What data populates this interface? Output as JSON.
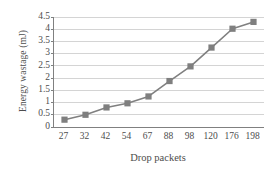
{
  "chart_data": {
    "type": "line",
    "title": "",
    "subtitle": "",
    "xlabel": "Drop packets",
    "ylabel": "Energy wastage (mJ)",
    "categories": [
      "27",
      "32",
      "42",
      "54",
      "67",
      "88",
      "98",
      "120",
      "176",
      "198"
    ],
    "values": [
      0.3,
      0.5,
      0.8,
      0.97,
      1.25,
      1.88,
      2.48,
      3.25,
      4.02,
      4.3
    ],
    "series": [
      {
        "name": "Energy wastage",
        "values": [
          0.3,
          0.5,
          0.8,
          0.97,
          1.25,
          1.88,
          2.48,
          3.25,
          4.02,
          4.3
        ]
      }
    ],
    "ylim": [
      0,
      4.5
    ],
    "yticks": [
      "0",
      "0.5",
      "1",
      "1.5",
      "2",
      "2.5",
      "3",
      "3.5",
      "4",
      "4.5"
    ],
    "ytick_values": [
      0,
      0.5,
      1,
      1.5,
      2,
      2.5,
      3,
      3.5,
      4,
      4.5
    ],
    "grid": true,
    "grid_axis": "y",
    "legend": false,
    "legend_position": "none",
    "marker": "square",
    "colors": {
      "line": "#808080",
      "marker": "#7f7f7f",
      "grid": "#d4d4d4",
      "axis": "#808080",
      "text": "#4d4d4d",
      "background": "#ffffff"
    }
  }
}
